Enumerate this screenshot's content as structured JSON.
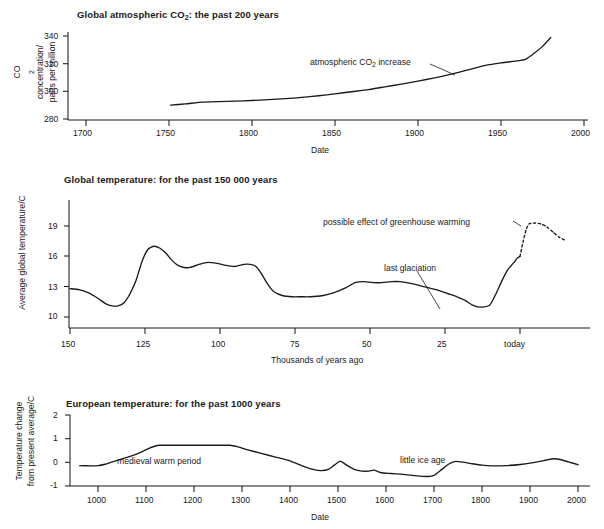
{
  "figure": {
    "panels": [
      "co2",
      "global_temperature",
      "european_temperature"
    ]
  },
  "chart_data": [
    {
      "id": "co2",
      "type": "line",
      "title": "Global atmospheric CO2: the past 200 years",
      "title_prefix": "Global atmospheric CO",
      "title_sub": "2",
      "title_suffix": ": the past 200 years",
      "xlabel": "Date",
      "ylabel_line1": "CO2 concentration/",
      "ylabel_line1_prefix": "CO",
      "ylabel_line1_sub": "2",
      "ylabel_line1_suffix": " concentration/",
      "ylabel_line2": "parts per million",
      "xticks": [
        "1700",
        "1750",
        "1800",
        "1850",
        "1900",
        "1950",
        "2000"
      ],
      "xtick_values": [
        1700,
        1750,
        1800,
        1850,
        1900,
        1950,
        2000
      ],
      "yticks": [
        "280",
        "300",
        "320",
        "340"
      ],
      "ytick_values": [
        280,
        300,
        320,
        340
      ],
      "xlim": [
        1680,
        2000
      ],
      "ylim": [
        278,
        342
      ],
      "grid": false,
      "legend": "none",
      "annotations": [
        {
          "text": "atmospheric CO2 increase",
          "prefix": "atmospheric CO",
          "sub": "2",
          "suffix": " increase",
          "x": 1838,
          "y": 317
        }
      ],
      "series": [
        {
          "name": "atmospheric CO2 increase",
          "style": "solid",
          "x": [
            1751,
            1760,
            1770,
            1780,
            1790,
            1800,
            1810,
            1820,
            1830,
            1840,
            1850,
            1860,
            1870,
            1880,
            1890,
            1900,
            1910,
            1920,
            1930,
            1940,
            1950,
            1960,
            1965,
            1970,
            1975,
            1980
          ],
          "y": [
            290.0,
            290.9,
            292.2,
            292.6,
            292.9,
            293.4,
            294.0,
            294.7,
            295.6,
            296.8,
            298.2,
            299.7,
            301.2,
            303.2,
            305.2,
            307.4,
            309.7,
            312.4,
            315.5,
            318.6,
            320.6,
            322.0,
            323.3,
            327.5,
            332.5,
            339.0
          ]
        }
      ]
    },
    {
      "id": "global_temperature",
      "type": "line",
      "title": "Global temperature: for the past 150 000 years",
      "xlabel": "Thousands of years ago",
      "ylabel": "Average global temperature/C",
      "xticks": [
        "150",
        "125",
        "100",
        "75",
        "50",
        "25",
        "today"
      ],
      "xtick_values": [
        150,
        125,
        100,
        75,
        50,
        25,
        0
      ],
      "yticks": [
        "10",
        "13",
        "16",
        "19"
      ],
      "ytick_values": [
        10,
        13,
        16,
        19
      ],
      "xlim": [
        150,
        -22
      ],
      "ylim": [
        9,
        20.6
      ],
      "grid": false,
      "legend": "none",
      "annotations": [
        {
          "text": "possible effect of greenhouse warming",
          "x": 58,
          "y": 19.1
        },
        {
          "text": "last glaciation",
          "x": 37,
          "y": 15.0
        }
      ],
      "series": [
        {
          "name": "reconstructed global temperature",
          "style": "solid",
          "x": [
            150,
            147,
            144,
            141,
            138,
            136,
            134,
            132,
            130,
            128,
            126,
            124,
            122,
            120,
            118,
            116,
            114,
            112,
            110,
            107,
            104,
            101,
            98,
            95,
            92,
            90,
            88,
            86,
            84,
            82,
            79,
            76,
            73,
            70,
            66,
            62,
            58,
            55,
            52,
            49,
            46,
            43,
            40,
            36,
            32,
            28,
            24,
            21,
            18,
            16,
            14,
            12,
            10,
            8,
            6,
            4,
            2,
            1,
            0
          ],
          "y": [
            12.8,
            12.7,
            12.4,
            11.9,
            11.3,
            11.1,
            11.1,
            11.4,
            12.3,
            13.6,
            15.5,
            16.7,
            17.0,
            16.8,
            16.3,
            15.6,
            15.1,
            14.9,
            14.9,
            15.2,
            15.4,
            15.3,
            15.1,
            15.0,
            15.2,
            15.2,
            15.0,
            14.2,
            13.2,
            12.5,
            12.1,
            12.0,
            12.0,
            12.0,
            12.1,
            12.4,
            12.9,
            13.4,
            13.5,
            13.4,
            13.4,
            13.5,
            13.5,
            13.3,
            13.0,
            12.7,
            12.3,
            12.0,
            11.6,
            11.2,
            11.0,
            11.0,
            11.2,
            12.3,
            13.6,
            14.7,
            15.4,
            15.8,
            16.0
          ]
        },
        {
          "name": "possible effect of greenhouse warming",
          "style": "dashed",
          "x": [
            0,
            -1,
            -2,
            -3,
            -5,
            -7,
            -9,
            -11,
            -13,
            -15
          ],
          "y": [
            16.0,
            17.4,
            18.6,
            19.2,
            19.3,
            19.2,
            18.9,
            18.4,
            17.9,
            17.6
          ]
        }
      ]
    },
    {
      "id": "european_temperature",
      "type": "line",
      "title": "European temperature: for the past 1000 years",
      "xlabel": "Date",
      "ylabel_line1": "Temperature change",
      "ylabel_line2": "from present average/C",
      "xticks": [
        "1000",
        "1100",
        "1200",
        "1300",
        "1400",
        "1500",
        "1600",
        "1700",
        "1800",
        "1900",
        "2000"
      ],
      "xtick_values": [
        1000,
        1100,
        1200,
        1300,
        1400,
        1500,
        1600,
        1700,
        1800,
        1900,
        2000
      ],
      "yticks": [
        "-1",
        "0",
        "1",
        "2"
      ],
      "ytick_values": [
        -1,
        0,
        1,
        2
      ],
      "xlim": [
        960,
        2000
      ],
      "ylim": [
        -1,
        2
      ],
      "grid": false,
      "legend": "none",
      "annotations": [
        {
          "text": "medieval warm period",
          "x": 1190,
          "y": 0.28
        },
        {
          "text": "little ice age",
          "x": 1640,
          "y": 0.1
        }
      ],
      "series": [
        {
          "name": "European temperature change from present average",
          "style": "solid",
          "x": [
            962,
            985,
            1000,
            1015,
            1030,
            1050,
            1070,
            1090,
            1105,
            1118,
            1128,
            1160,
            1200,
            1240,
            1275,
            1290,
            1310,
            1340,
            1370,
            1400,
            1430,
            1450,
            1465,
            1480,
            1492,
            1505,
            1518,
            1535,
            1550,
            1565,
            1575,
            1590,
            1610,
            1630,
            1650,
            1670,
            1688,
            1700,
            1715,
            1730,
            1745,
            1760,
            1780,
            1800,
            1820,
            1850,
            1880,
            1910,
            1935,
            1950,
            1965,
            1980,
            2000
          ],
          "y": [
            -0.14,
            -0.15,
            -0.14,
            -0.08,
            0.02,
            0.14,
            0.27,
            0.43,
            0.58,
            0.68,
            0.72,
            0.72,
            0.72,
            0.72,
            0.72,
            0.66,
            0.54,
            0.38,
            0.22,
            0.06,
            -0.18,
            -0.31,
            -0.35,
            -0.3,
            -0.12,
            0.05,
            -0.12,
            -0.31,
            -0.37,
            -0.37,
            -0.33,
            -0.44,
            -0.47,
            -0.5,
            -0.54,
            -0.58,
            -0.6,
            -0.55,
            -0.32,
            -0.08,
            0.04,
            0.01,
            -0.06,
            -0.12,
            -0.15,
            -0.14,
            -0.09,
            0.0,
            0.1,
            0.15,
            0.11,
            0.02,
            -0.1
          ]
        }
      ]
    }
  ]
}
